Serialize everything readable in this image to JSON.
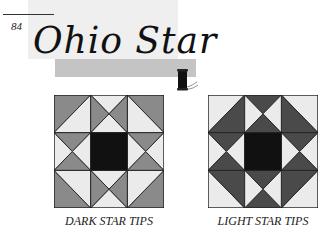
{
  "header": {
    "page_number": "84",
    "title": "Ohio Star",
    "spool_icon": "thread-spool-icon"
  },
  "colors": {
    "light": "#ebebeb",
    "medium": "#8a8a8a",
    "dark": "#4a4a4a",
    "center": "#111111",
    "line": "#222222"
  },
  "blocks": [
    {
      "caption": "DARK STAR TIPS",
      "variant": "dark-tips"
    },
    {
      "caption": "LIGHT STAR TIPS",
      "variant": "light-tips"
    }
  ]
}
